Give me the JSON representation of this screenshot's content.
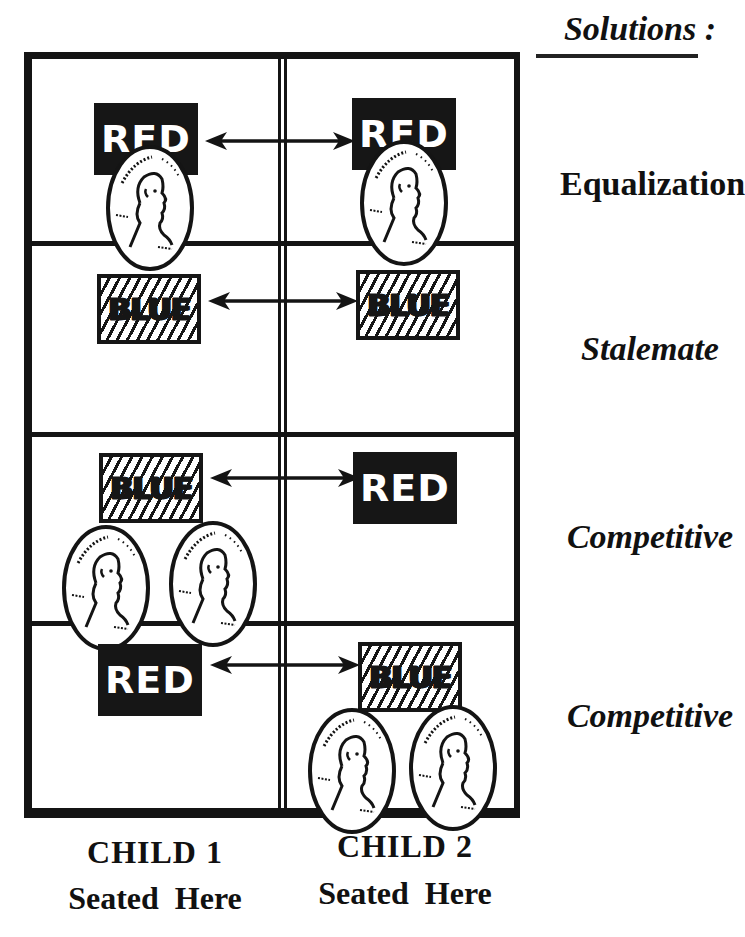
{
  "header": {
    "title": "Solutions :"
  },
  "colors": {
    "ink": "#141414",
    "background": "#ffffff",
    "label_text": "#ffffff"
  },
  "rows": [
    {
      "left": {
        "label": "RED",
        "style": "solid",
        "pennies": 1
      },
      "right": {
        "label": "RED",
        "style": "solid",
        "pennies": 1
      },
      "connector": "double-headed-arrow",
      "solution": "Equalization"
    },
    {
      "left": {
        "label": "BLUE",
        "style": "hatched",
        "pennies": 0
      },
      "right": {
        "label": "BLUE",
        "style": "hatched",
        "pennies": 0
      },
      "connector": "double-headed-arrow",
      "solution": "Stalemate"
    },
    {
      "left": {
        "label": "BLUE",
        "style": "hatched",
        "pennies": 2
      },
      "right": {
        "label": "RED",
        "style": "solid",
        "pennies": 0
      },
      "connector": "double-headed-arrow",
      "solution": "Competitive"
    },
    {
      "left": {
        "label": "RED",
        "style": "solid",
        "pennies": 0
      },
      "right": {
        "label": "BLUE",
        "style": "hatched",
        "pennies": 2
      },
      "connector": "double-headed-arrow",
      "solution": "Competitive"
    }
  ],
  "columns": [
    {
      "child": "CHILD  1",
      "seat": "Seated  Here"
    },
    {
      "child": "CHILD  2",
      "seat": "Seated  Here"
    }
  ],
  "icons": {
    "coin": "penny-icon",
    "arrow": "double-arrow-icon"
  }
}
